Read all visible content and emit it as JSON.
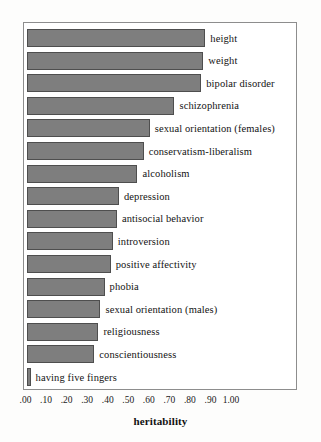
{
  "chart_data": {
    "type": "bar",
    "orientation": "horizontal",
    "title": "",
    "xlabel": "heritability",
    "ylabel": "",
    "xlim": [
      0.0,
      1.0
    ],
    "grid": false,
    "legend": null,
    "bar_color": "#7e7e7e",
    "bar_edge_color": "#4e4e4e",
    "frame_color": "#8d8d8d",
    "background": "#ffffff",
    "xticks": [
      ".00",
      ".10",
      ".20",
      ".30",
      ".40",
      ".50",
      ".60",
      ".70",
      ".80",
      ".90",
      "1.00"
    ],
    "xtick_values": [
      0.0,
      0.1,
      0.2,
      0.3,
      0.4,
      0.5,
      0.6,
      0.7,
      0.8,
      0.9,
      1.0
    ],
    "categories": [
      "height",
      "weight",
      "bipolar disorder",
      "schizophrenia",
      "sexual orientation (females)",
      "conservatism-liberalism",
      "alcoholism",
      "depression",
      "antisocial behavior",
      "introversion",
      "positive affectivity",
      "phobia",
      "sexual orientation (males)",
      "religiousness",
      "conscientiousness",
      "having five fingers"
    ],
    "values": [
      0.87,
      0.86,
      0.85,
      0.72,
      0.6,
      0.57,
      0.54,
      0.45,
      0.44,
      0.42,
      0.41,
      0.38,
      0.36,
      0.35,
      0.33,
      0.02
    ]
  }
}
